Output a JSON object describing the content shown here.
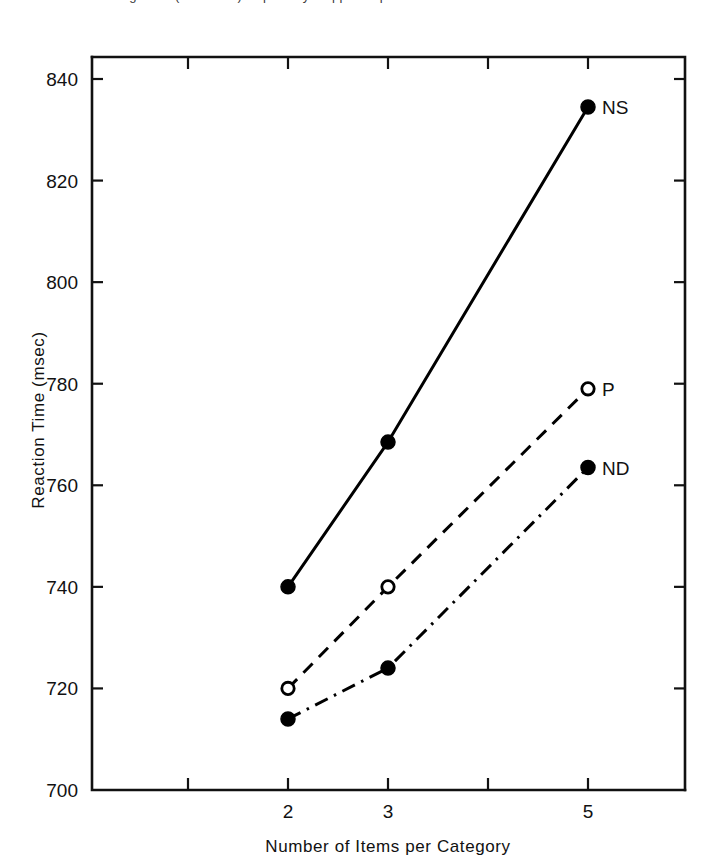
{
  "figure": {
    "top_caption_fragment": "Figure 2. (continued) — partially cropped caption"
  },
  "chart_data": {
    "type": "line",
    "title": "",
    "xlabel": "Number of Items per Category",
    "ylabel": "Reaction Time (msec)",
    "x": [
      2,
      3,
      5
    ],
    "xlim": [
      1,
      5.6
    ],
    "ylim": [
      700,
      846
    ],
    "xticks": [
      1,
      2,
      3,
      4,
      5
    ],
    "xtick_labels": [
      "",
      "2",
      "3",
      "",
      "5"
    ],
    "yticks": [
      700,
      720,
      740,
      760,
      780,
      800,
      820,
      840
    ],
    "ytick_labels": [
      "700",
      "720",
      "740",
      "760",
      "780",
      "800",
      "820",
      "840"
    ],
    "grid": false,
    "legend_position": "inline-right-of-endpoint",
    "series": [
      {
        "name": "NS",
        "label": "NS",
        "linestyle": "solid",
        "marker": "filled-circle",
        "color": "#000000",
        "values": [
          740,
          768.5,
          834.5
        ]
      },
      {
        "name": "P",
        "label": "P",
        "linestyle": "dashed",
        "marker": "open-circle",
        "color": "#000000",
        "values": [
          720,
          740,
          779
        ]
      },
      {
        "name": "ND",
        "label": "ND",
        "linestyle": "dashdot",
        "marker": "filled-circle",
        "color": "#000000",
        "values": [
          714,
          724,
          763.5
        ]
      }
    ]
  }
}
